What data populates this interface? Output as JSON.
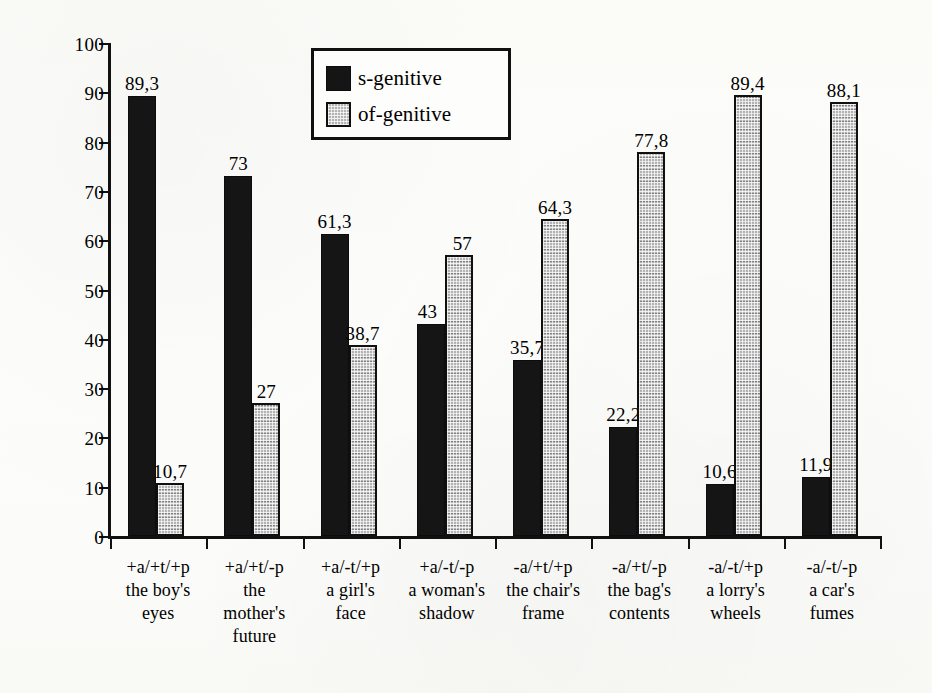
{
  "chart_data": {
    "type": "bar",
    "title": "",
    "subtitle": "",
    "xlabel": "",
    "ylabel": "relative frequency (in %)",
    "ylim": [
      0,
      100
    ],
    "ytick_values": [
      0,
      10,
      20,
      30,
      40,
      50,
      60,
      70,
      80,
      90,
      100
    ],
    "ytick_labels": [
      "0",
      "10",
      "20",
      "30",
      "40",
      "50",
      "60",
      "70",
      "80",
      "90",
      "100"
    ],
    "grid": false,
    "legend_position": "upper-center-left",
    "decimal_separator": ",",
    "categories": [
      "+a/+t/+p",
      "+a/+t/-p",
      "+a/-t/+p",
      "+a/-t/-p",
      "-a/+t/+p",
      "-a/+t/-p",
      "-a/-t/+p",
      "-a/-t/-p"
    ],
    "category_examples": [
      [
        "the boy's",
        "eyes"
      ],
      [
        "the",
        "mother's",
        "future"
      ],
      [
        "a girl's",
        "face"
      ],
      [
        "a woman's",
        "shadow"
      ],
      [
        "the chair's",
        "frame"
      ],
      [
        "the bag's",
        "contents"
      ],
      [
        "a lorry's",
        "wheels"
      ],
      [
        "a car's",
        "fumes"
      ]
    ],
    "series": [
      {
        "name": "s-genitive",
        "color": "#151515",
        "values": [
          89.3,
          73,
          61.3,
          43,
          35.7,
          22.2,
          10.6,
          11.9
        ],
        "value_labels": [
          "89,3",
          "73",
          "61,3",
          "43",
          "35,7",
          "22,2",
          "10,6",
          "11,9"
        ]
      },
      {
        "name": "of-genitive",
        "color": "#b3b3b3",
        "values": [
          10.7,
          27,
          38.7,
          57,
          64.3,
          77.8,
          89.4,
          88.1
        ],
        "value_labels": [
          "10,7",
          "27",
          "38,7",
          "57",
          "64,3",
          "77,8",
          "89,4",
          "88,1"
        ]
      }
    ]
  },
  "legend": {
    "items": [
      {
        "label": "s-genitive",
        "swatch": "s-genitive"
      },
      {
        "label": "of-genitive",
        "swatch": "of-genitive"
      }
    ]
  }
}
